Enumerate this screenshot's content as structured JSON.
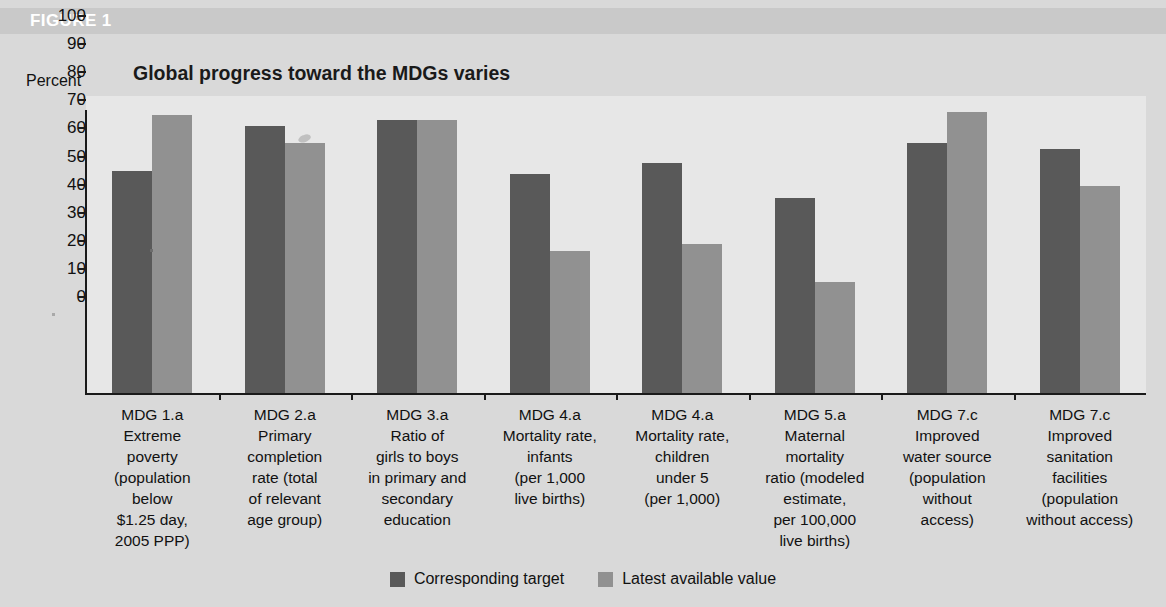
{
  "figure": {
    "label": "FIGURE 1",
    "title_line_1": "Global progress toward the MDGs varies",
    "title_line_2": "(developing countries, weighted by population)"
  },
  "colors": {
    "background": "#d9d9d9",
    "plot_background": "#e7e7e7",
    "header_band": "#c9c9c9",
    "target_bar": "#595959",
    "latest_bar": "#919191",
    "axis": "#1a1a1a",
    "figure_label_text": "#ffffff"
  },
  "chart_data": {
    "type": "bar",
    "title": "Global progress toward the MDGs varies (developing countries, weighted by population)",
    "xlabel": "",
    "ylabel": "Percent",
    "ylim": [
      0,
      100
    ],
    "yticks": [
      0,
      10,
      20,
      30,
      40,
      50,
      60,
      70,
      80,
      90,
      100
    ],
    "ytick_labels": [
      "0",
      "10",
      "20",
      "30",
      "40",
      "50",
      "60",
      "70",
      "80",
      "90",
      "100"
    ],
    "grid": false,
    "legend_position": "bottom-center",
    "categories": [
      "MDG 1.a Extreme poverty (population below $1.25 day, 2005 PPP)",
      "MDG 2.a Primary completion rate (total of relevant age group)",
      "MDG 3.a Ratio of girls to boys in primary and secondary education",
      "MDG 4.a Mortality rate, infants (per 1,000 live births)",
      "MDG 4.a Mortality rate, children under 5 (per 1,000)",
      "MDG 5.a Maternal mortality ratio (modeled estimate, per 100,000 live births)",
      "MDG 7.c Improved water source (population without access)",
      "MDG 7.c Improved sanitation facilities (population without access)"
    ],
    "category_lines": [
      [
        "MDG 1.a",
        "Extreme",
        "poverty",
        "(population",
        "below",
        "$1.25 day,",
        "2005 PPP)"
      ],
      [
        "MDG 2.a",
        "Primary",
        "completion",
        "rate (total",
        "of relevant",
        "age group)"
      ],
      [
        "MDG 3.a",
        "Ratio of",
        "girls to boys",
        "in primary and",
        "secondary",
        "education"
      ],
      [
        "MDG 4.a",
        "Mortality rate,",
        "infants",
        "(per 1,000",
        "live births)"
      ],
      [
        "MDG 4.a",
        "Mortality rate,",
        "children",
        "under 5",
        "(per 1,000)"
      ],
      [
        "MDG 5.a",
        "Maternal",
        "mortality",
        "ratio (modeled",
        "estimate,",
        "per 100,000",
        "live births)"
      ],
      [
        "MDG 7.c",
        "Improved",
        "water source",
        "(population",
        "without",
        "access)"
      ],
      [
        "MDG 7.c",
        "Improved",
        "sanitation",
        "facilities",
        "(population",
        "without access)"
      ]
    ],
    "series": [
      {
        "name": "Corresponding target",
        "color": "#595959",
        "values": [
          79,
          95,
          97,
          78,
          82,
          69.5,
          89,
          87
        ]
      },
      {
        "name": "Latest available value",
        "color": "#919191",
        "values": [
          99,
          89,
          97,
          50.5,
          53,
          39.5,
          100,
          73.5
        ]
      }
    ]
  },
  "legend": {
    "items": [
      {
        "label": "Corresponding target",
        "color": "#595959"
      },
      {
        "label": "Latest available value",
        "color": "#919191"
      }
    ]
  }
}
